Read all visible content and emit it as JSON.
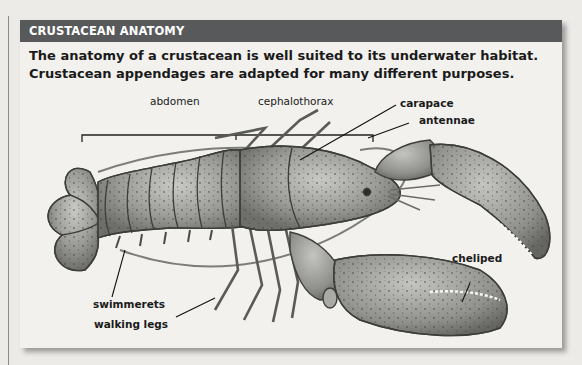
{
  "header": {
    "title": "CRUSTACEAN ANATOMY"
  },
  "intro": {
    "line1": "The anatomy of a crustacean is well suited to its underwater habitat.",
    "line2": "Crustacean appendages are adapted for many different purposes."
  },
  "labels": {
    "abdomen": "abdomen",
    "cephalothorax": "cephalothorax",
    "carapace": "carapace",
    "antennae": "antennae",
    "swimmerets": "swimmerets",
    "walking_legs": "walking legs",
    "cheliped": "cheliped"
  },
  "colors": {
    "header_bg": "#58595b",
    "panel_bg": "#f2f1ee",
    "lobster_body": "#9a9a96",
    "lobster_dark": "#4a4a48",
    "label_text": "#1a1a1a"
  }
}
